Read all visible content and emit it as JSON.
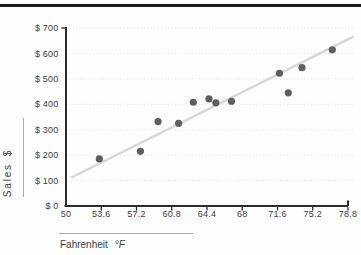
{
  "page": {
    "background": "#fefefe",
    "top_rule_color": "#1c1c1c"
  },
  "chart_data": {
    "type": "scatter",
    "title": "",
    "xlabel": "Fahrenheit",
    "xlabel_unit": "°F",
    "ylabel": "Sales",
    "ylabel_unit": "$",
    "xlim": [
      50,
      78.8
    ],
    "ylim": [
      0,
      700
    ],
    "grid": "horizontal-dotted",
    "legend": "none",
    "x_ticks": [
      {
        "value": 50,
        "label": "50"
      },
      {
        "value": 53.6,
        "label": "53.6"
      },
      {
        "value": 57.2,
        "label": "57.2"
      },
      {
        "value": 60.8,
        "label": "60.8"
      },
      {
        "value": 64.4,
        "label": "64.4"
      },
      {
        "value": 68,
        "label": "68"
      },
      {
        "value": 71.6,
        "label": "71.6"
      },
      {
        "value": 75.2,
        "label": "75.2"
      },
      {
        "value": 78.8,
        "label": "78.8"
      }
    ],
    "y_ticks": [
      {
        "value": 0,
        "label": "$ 0"
      },
      {
        "value": 100,
        "label": "$ 100"
      },
      {
        "value": 200,
        "label": "$ 200"
      },
      {
        "value": 300,
        "label": "$ 300"
      },
      {
        "value": 400,
        "label": "$ 400"
      },
      {
        "value": 500,
        "label": "$ 500"
      },
      {
        "value": 600,
        "label": "$ 600"
      },
      {
        "value": 700,
        "label": "$ 700"
      }
    ],
    "points": [
      {
        "x": 53.4,
        "y": 185
      },
      {
        "x": 57.6,
        "y": 215
      },
      {
        "x": 59.4,
        "y": 332
      },
      {
        "x": 61.5,
        "y": 325
      },
      {
        "x": 63.0,
        "y": 408
      },
      {
        "x": 64.6,
        "y": 421
      },
      {
        "x": 65.3,
        "y": 406
      },
      {
        "x": 66.9,
        "y": 412
      },
      {
        "x": 71.8,
        "y": 522
      },
      {
        "x": 72.7,
        "y": 445
      },
      {
        "x": 74.1,
        "y": 544
      },
      {
        "x": 77.2,
        "y": 614
      }
    ],
    "trendline": {
      "x1": 50.6,
      "y1": 113,
      "x2": 79.3,
      "y2": 665
    },
    "colors": {
      "point": "#5f5f5f",
      "trend": "#d6d6d6",
      "gridline": "#dedede",
      "axis": "#2b2b2b",
      "label": "#3c3c3c"
    }
  }
}
